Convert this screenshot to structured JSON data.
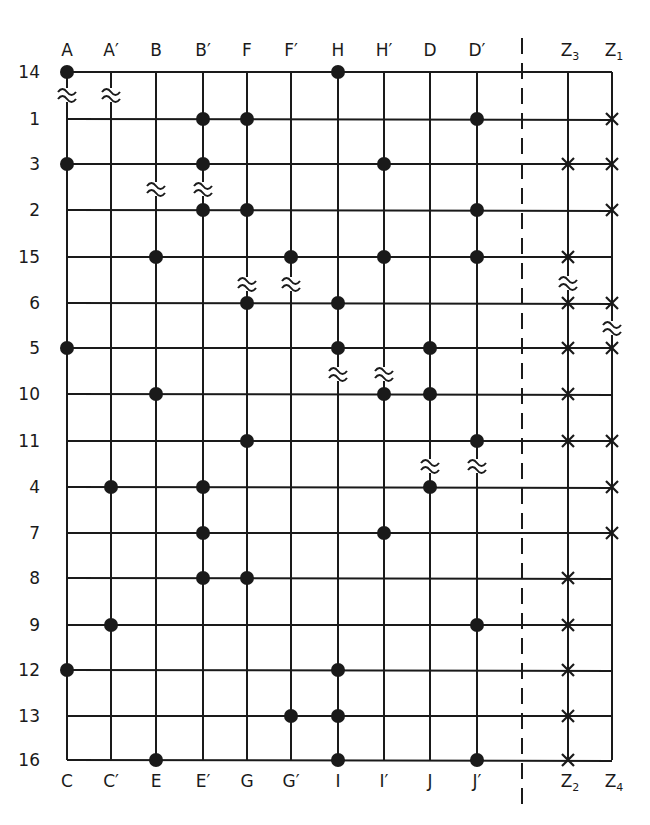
{
  "diagram": {
    "colors": {
      "ink": "#1a1a1a",
      "background": "#ffffff"
    },
    "columns": [
      {
        "id": "A",
        "top": "A",
        "bottom": "C",
        "x": 67
      },
      {
        "id": "A'",
        "top": "A′",
        "bottom": "C′",
        "x": 111
      },
      {
        "id": "B",
        "top": "B",
        "bottom": "E",
        "x": 156
      },
      {
        "id": "B'",
        "top": "B′",
        "bottom": "E′",
        "x": 203
      },
      {
        "id": "F",
        "top": "F",
        "bottom": "G",
        "x": 247
      },
      {
        "id": "F'",
        "top": "F′",
        "bottom": "G′",
        "x": 291
      },
      {
        "id": "H",
        "top": "H",
        "bottom": "I",
        "x": 338
      },
      {
        "id": "H'",
        "top": "H′",
        "bottom": "I′",
        "x": 384
      },
      {
        "id": "D",
        "top": "D",
        "bottom": "J",
        "x": 430
      },
      {
        "id": "D'",
        "top": "D′",
        "bottom": "J′",
        "x": 477
      },
      {
        "id": "Z3",
        "top": "Z",
        "top_sub": "3",
        "bottom": "Z",
        "bottom_sub": "2",
        "x": 568
      },
      {
        "id": "Z1",
        "top": "Z",
        "top_sub": "1",
        "bottom": "Z",
        "bottom_sub": "4",
        "x": 612
      }
    ],
    "rows": [
      {
        "label": "14",
        "y": 72
      },
      {
        "label": "1",
        "y": 119
      },
      {
        "label": "3",
        "y": 164
      },
      {
        "label": "2",
        "y": 210
      },
      {
        "label": "15",
        "y": 257
      },
      {
        "label": "6",
        "y": 303
      },
      {
        "label": "5",
        "y": 348
      },
      {
        "label": "10",
        "y": 394
      },
      {
        "label": "11",
        "y": 441
      },
      {
        "label": "4",
        "y": 487
      },
      {
        "label": "7",
        "y": 533
      },
      {
        "label": "8",
        "y": 578
      },
      {
        "label": "9",
        "y": 625
      },
      {
        "label": "12",
        "y": 670
      },
      {
        "label": "13",
        "y": 716
      },
      {
        "label": "16",
        "y": 760
      }
    ],
    "dots": [
      {
        "row": "14",
        "col": "A"
      },
      {
        "row": "14",
        "col": "H"
      },
      {
        "row": "1",
        "col": "B'"
      },
      {
        "row": "1",
        "col": "F"
      },
      {
        "row": "1",
        "col": "D'"
      },
      {
        "row": "3",
        "col": "A"
      },
      {
        "row": "3",
        "col": "B'"
      },
      {
        "row": "3",
        "col": "H'"
      },
      {
        "row": "2",
        "col": "B'"
      },
      {
        "row": "2",
        "col": "F"
      },
      {
        "row": "2",
        "col": "D'"
      },
      {
        "row": "15",
        "col": "B"
      },
      {
        "row": "15",
        "col": "F'"
      },
      {
        "row": "15",
        "col": "H'"
      },
      {
        "row": "15",
        "col": "D'"
      },
      {
        "row": "6",
        "col": "F"
      },
      {
        "row": "6",
        "col": "H"
      },
      {
        "row": "5",
        "col": "A"
      },
      {
        "row": "5",
        "col": "H"
      },
      {
        "row": "5",
        "col": "D"
      },
      {
        "row": "10",
        "col": "B"
      },
      {
        "row": "10",
        "col": "H'"
      },
      {
        "row": "10",
        "col": "D"
      },
      {
        "row": "11",
        "col": "F"
      },
      {
        "row": "11",
        "col": "D'"
      },
      {
        "row": "4",
        "col": "A'"
      },
      {
        "row": "4",
        "col": "B'"
      },
      {
        "row": "4",
        "col": "D"
      },
      {
        "row": "7",
        "col": "B'"
      },
      {
        "row": "7",
        "col": "H'"
      },
      {
        "row": "8",
        "col": "B'"
      },
      {
        "row": "8",
        "col": "F"
      },
      {
        "row": "9",
        "col": "A'"
      },
      {
        "row": "9",
        "col": "D'"
      },
      {
        "row": "12",
        "col": "A"
      },
      {
        "row": "12",
        "col": "H"
      },
      {
        "row": "13",
        "col": "F'"
      },
      {
        "row": "13",
        "col": "H"
      },
      {
        "row": "16",
        "col": "B"
      },
      {
        "row": "16",
        "col": "H"
      },
      {
        "row": "16",
        "col": "D'"
      }
    ],
    "crosses": [
      {
        "row": "1",
        "col": "Z1"
      },
      {
        "row": "3",
        "col": "Z1"
      },
      {
        "row": "2",
        "col": "Z1"
      },
      {
        "row": "6",
        "col": "Z1"
      },
      {
        "row": "5",
        "col": "Z1"
      },
      {
        "row": "11",
        "col": "Z1"
      },
      {
        "row": "4",
        "col": "Z1"
      },
      {
        "row": "7",
        "col": "Z1"
      },
      {
        "row": "3",
        "col": "Z3"
      },
      {
        "row": "15",
        "col": "Z3"
      },
      {
        "row": "6",
        "col": "Z3"
      },
      {
        "row": "5",
        "col": "Z3"
      },
      {
        "row": "10",
        "col": "Z3"
      },
      {
        "row": "11",
        "col": "Z3"
      },
      {
        "row": "8",
        "col": "Z3"
      },
      {
        "row": "9",
        "col": "Z3"
      },
      {
        "row": "12",
        "col": "Z3"
      },
      {
        "row": "13",
        "col": "Z3"
      },
      {
        "row": "16",
        "col": "Z3"
      }
    ],
    "breaks": [
      {
        "col": "A",
        "y": 95
      },
      {
        "col": "A'",
        "y": 95
      },
      {
        "col": "B",
        "y": 189
      },
      {
        "col": "B'",
        "y": 189
      },
      {
        "col": "F",
        "y": 284
      },
      {
        "col": "F'",
        "y": 284
      },
      {
        "col": "H",
        "y": 374
      },
      {
        "col": "H'",
        "y": 374
      },
      {
        "col": "D",
        "y": 466
      },
      {
        "col": "D'",
        "y": 466
      },
      {
        "col": "Z3",
        "y": 283
      },
      {
        "col": "Z1",
        "y": 328
      }
    ],
    "separator": {
      "style": "dashed",
      "x": 522,
      "y_top": 38,
      "y_bottom": 812
    }
  }
}
